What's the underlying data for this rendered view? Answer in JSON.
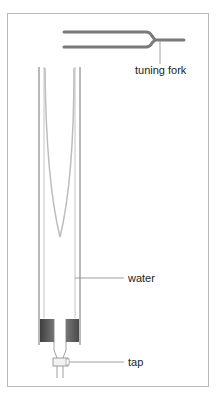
{
  "figure": {
    "labels": {
      "tuning_fork": "tuning fork",
      "water": "water",
      "tap": "tap"
    },
    "colors": {
      "frame": "#b9b9b9",
      "fork": "#7a7a7a",
      "tube": "#8a8a8a",
      "meniscus": "#bdbdbd",
      "stopper_dark": "#4a4a4a",
      "stopper_light": "#9a9a9a",
      "leader": "#888888",
      "text": "#222222"
    }
  }
}
